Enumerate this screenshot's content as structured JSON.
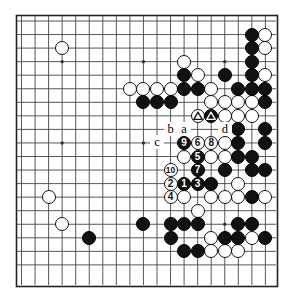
{
  "diagram": {
    "type": "go-board-problem-diagram",
    "board_size": 19,
    "visible_grid": {
      "cols": 19,
      "rows": 19,
      "cropped": true
    },
    "colors": {
      "black_stone": "#111111",
      "white_stone": "#ffffff",
      "stone_outline": "#111111",
      "grid_line": "#444444",
      "board_background": "#ffffff",
      "border": "#222222"
    },
    "letter_markers": [
      {
        "label": "b",
        "col": 11,
        "row": 8
      },
      {
        "label": "a",
        "col": 12,
        "row": 8
      },
      {
        "label": "d",
        "col": 15,
        "row": 8
      },
      {
        "label": "c",
        "col": 10,
        "row": 9
      }
    ],
    "triangle_markers": [
      {
        "on": "white",
        "col": 13,
        "row": 7
      },
      {
        "on": "black",
        "col": 14,
        "row": 7
      }
    ],
    "numbered_moves": [
      {
        "n": 1,
        "color": "black",
        "col": 12,
        "row": 12
      },
      {
        "n": 2,
        "color": "white",
        "col": 11,
        "row": 12
      },
      {
        "n": 3,
        "color": "black",
        "col": 13,
        "row": 12
      },
      {
        "n": 4,
        "color": "white",
        "col": 11,
        "row": 13
      },
      {
        "n": 5,
        "color": "black",
        "col": 13,
        "row": 10
      },
      {
        "n": 6,
        "color": "white",
        "col": 13,
        "row": 9
      },
      {
        "n": 7,
        "color": "black",
        "col": 13,
        "row": 11
      },
      {
        "n": 8,
        "color": "white",
        "col": 14,
        "row": 9
      },
      {
        "n": 9,
        "color": "black",
        "col": 12,
        "row": 9
      },
      {
        "n": 10,
        "color": "white",
        "col": 11,
        "row": 11
      }
    ],
    "black_stones": [
      {
        "col": 17,
        "row": 1
      },
      {
        "col": 17,
        "row": 2
      },
      {
        "col": 17,
        "row": 3
      },
      {
        "col": 12,
        "row": 4
      },
      {
        "col": 15,
        "row": 4
      },
      {
        "col": 17,
        "row": 4
      },
      {
        "col": 12,
        "row": 5
      },
      {
        "col": 13,
        "row": 5
      },
      {
        "col": 16,
        "row": 5
      },
      {
        "col": 17,
        "row": 5
      },
      {
        "col": 18,
        "row": 5
      },
      {
        "col": 9,
        "row": 6
      },
      {
        "col": 10,
        "row": 6
      },
      {
        "col": 11,
        "row": 6
      },
      {
        "col": 18,
        "row": 6
      },
      {
        "col": 14,
        "row": 7
      },
      {
        "col": 12,
        "row": 8
      },
      {
        "col": 16,
        "row": 8
      },
      {
        "col": 18,
        "row": 8
      },
      {
        "col": 16,
        "row": 9
      },
      {
        "col": 18,
        "row": 9
      },
      {
        "col": 16,
        "row": 10
      },
      {
        "col": 17,
        "row": 10
      },
      {
        "col": 15,
        "row": 11
      },
      {
        "col": 17,
        "row": 11
      },
      {
        "col": 18,
        "row": 11
      },
      {
        "col": 14,
        "row": 12
      },
      {
        "col": 17,
        "row": 13
      },
      {
        "col": 9,
        "row": 15
      },
      {
        "col": 11,
        "row": 15
      },
      {
        "col": 12,
        "row": 15
      },
      {
        "col": 13,
        "row": 15
      },
      {
        "col": 16,
        "row": 15
      },
      {
        "col": 17,
        "row": 15
      },
      {
        "col": 5,
        "row": 16
      },
      {
        "col": 11,
        "row": 16
      },
      {
        "col": 15,
        "row": 16
      },
      {
        "col": 16,
        "row": 16
      },
      {
        "col": 18,
        "row": 16
      },
      {
        "col": 12,
        "row": 17
      },
      {
        "col": 13,
        "row": 17
      }
    ],
    "white_stones": [
      {
        "col": 3,
        "row": 2
      },
      {
        "col": 18,
        "row": 1
      },
      {
        "col": 18,
        "row": 2
      },
      {
        "col": 12,
        "row": 3
      },
      {
        "col": 13,
        "row": 4
      },
      {
        "col": 8,
        "row": 5
      },
      {
        "col": 9,
        "row": 5
      },
      {
        "col": 10,
        "row": 5
      },
      {
        "col": 11,
        "row": 5
      },
      {
        "col": 14,
        "row": 5
      },
      {
        "col": 18,
        "row": 4
      },
      {
        "col": 14,
        "row": 6
      },
      {
        "col": 15,
        "row": 6
      },
      {
        "col": 16,
        "row": 6
      },
      {
        "col": 17,
        "row": 6
      },
      {
        "col": 13,
        "row": 7
      },
      {
        "col": 15,
        "row": 7
      },
      {
        "col": 16,
        "row": 7
      },
      {
        "col": 17,
        "row": 7
      },
      {
        "col": 15,
        "row": 9
      },
      {
        "col": 12,
        "row": 10
      },
      {
        "col": 14,
        "row": 10
      },
      {
        "col": 15,
        "row": 10
      },
      {
        "col": 16,
        "row": 12
      },
      {
        "col": 12,
        "row": 13
      },
      {
        "col": 14,
        "row": 13
      },
      {
        "col": 15,
        "row": 13
      },
      {
        "col": 16,
        "row": 13
      },
      {
        "col": 18,
        "row": 13
      },
      {
        "col": 2,
        "row": 13
      },
      {
        "col": 13,
        "row": 14
      },
      {
        "col": 3,
        "row": 15
      },
      {
        "col": 14,
        "row": 16
      },
      {
        "col": 17,
        "row": 16
      },
      {
        "col": 14,
        "row": 17
      },
      {
        "col": 15,
        "row": 17
      },
      {
        "col": 16,
        "row": 17
      }
    ],
    "star_points": [
      {
        "col": 3,
        "row": 3
      },
      {
        "col": 9,
        "row": 3
      },
      {
        "col": 15,
        "row": 3
      },
      {
        "col": 3,
        "row": 9
      },
      {
        "col": 9,
        "row": 9
      },
      {
        "col": 15,
        "row": 9
      },
      {
        "col": 3,
        "row": 15
      },
      {
        "col": 9,
        "row": 15
      },
      {
        "col": 15,
        "row": 15
      }
    ]
  },
  "geometry": {
    "origin_x": 21.5,
    "origin_y": 21.0,
    "step": 13.55,
    "stone_radius": 7.0,
    "board_left": 16,
    "board_top": 15,
    "board_right": 277,
    "board_bottom": 286
  }
}
